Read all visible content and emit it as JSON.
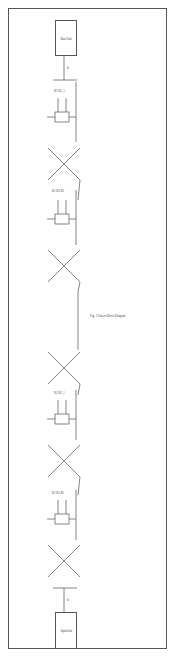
{
  "figure": {
    "caption": "Fig. 1 Pattern Block Diagram",
    "top_block": {
      "label": "Base Unit"
    },
    "bottom_block": {
      "label": "Input Unit"
    },
    "top_signal": "b",
    "bottom_signal": "b",
    "stages": [
      {
        "label": "R1  R2_1",
        "mid": "+V_DD"
      },
      {
        "label": "R1 R2 R3",
        "mid": "+V_DD"
      },
      {
        "label": "R1  R2_1",
        "mid": "+V_DD"
      },
      {
        "label": "R1 R2 R3",
        "mid": "+V_DD"
      }
    ]
  },
  "colors": {
    "line": "#555555",
    "background": "#ffffff"
  }
}
